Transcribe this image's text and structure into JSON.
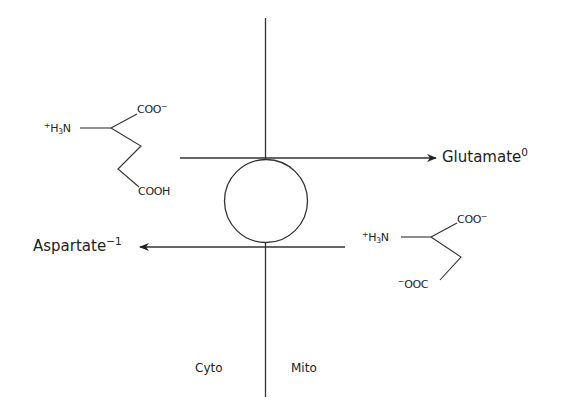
{
  "diagram": {
    "type": "membrane transport (antiporter) schematic",
    "stroke_color": "#333333",
    "membrane": {
      "left_compartment_label": "Cyto",
      "right_compartment_label": "Mito"
    },
    "transporter": {
      "shape": "circle"
    },
    "glutamate": {
      "name": "Glutamate",
      "charge": "0",
      "direction": "cyto-to-mito",
      "structure": {
        "amine_prefix": "+",
        "amine_main": "H",
        "amine_sub": "3",
        "amine_suffix": "N",
        "alpha_carboxyl": "COO",
        "alpha_carboxyl_charge": "−",
        "side_chain_carboxyl": "COOH"
      }
    },
    "aspartate": {
      "name": "Aspartate",
      "charge": "−1",
      "direction": "mito-to-cyto",
      "structure": {
        "amine_prefix": "+",
        "amine_main": "H",
        "amine_sub": "3",
        "amine_suffix": "N",
        "alpha_carboxyl": "COO",
        "alpha_carboxyl_charge": "−",
        "side_chain_charge": "−",
        "side_chain_carboxyl": "OOC"
      }
    }
  }
}
